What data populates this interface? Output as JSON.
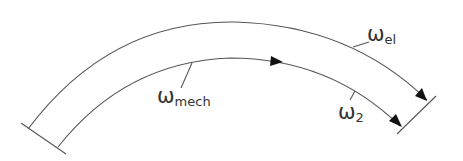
{
  "diagram": {
    "title": "",
    "colors": {
      "line": "#555555",
      "arrowhead": "#111111",
      "text": "#333333",
      "background": "#ffffff"
    },
    "labels": {
      "omega_el": {
        "symbol": "ω",
        "subscript": "el"
      },
      "omega_mech": {
        "symbol": "ω",
        "subscript": "mech"
      },
      "omega_2": {
        "symbol": "ω",
        "subscript": "2"
      }
    },
    "elements": [
      {
        "id": "outer-arc",
        "label": "ω_el",
        "arrow_at_end": true
      },
      {
        "id": "inner-arc",
        "label": "ω_mech",
        "arrow_at_mid": true,
        "arrow_at_end": true,
        "end_label": "ω_2"
      },
      {
        "id": "left-cap",
        "type": "end-line"
      },
      {
        "id": "right-cap",
        "type": "end-line"
      }
    ]
  }
}
